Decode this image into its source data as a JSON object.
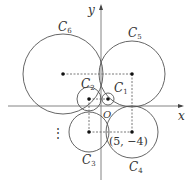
{
  "axes": {
    "x_label": "x",
    "y_label": "y",
    "origin_label": "O",
    "origin_px": [
      101,
      106
    ]
  },
  "circles": [
    {
      "name": "C1",
      "label": "C",
      "sub": "1",
      "cx": 108,
      "cy": 99,
      "r": 6,
      "label_pos": [
        114,
        92
      ]
    },
    {
      "name": "C2",
      "label": "C",
      "sub": "2",
      "cx": 89,
      "cy": 99,
      "r": 12,
      "label_pos": [
        81,
        88
      ]
    },
    {
      "name": "C3",
      "label": "C",
      "sub": "3",
      "cx": 89,
      "cy": 132,
      "r": 20,
      "label_pos": [
        82,
        164
      ]
    },
    {
      "name": "C4",
      "label": "C",
      "sub": "4",
      "cx": 132,
      "cy": 132,
      "r": 26,
      "label_pos": [
        129,
        171
      ]
    },
    {
      "name": "C5",
      "label": "C",
      "sub": "5",
      "cx": 132,
      "cy": 74,
      "r": 33,
      "label_pos": [
        128,
        37
      ]
    },
    {
      "name": "C6",
      "label": "C",
      "sub": "6",
      "cx": 63,
      "cy": 74,
      "r": 40,
      "label_pos": [
        58,
        31
      ]
    }
  ],
  "annotations": {
    "point_label": "(5,  −4)",
    "ellipsis": "⋮"
  },
  "colors": {
    "line": "#555555",
    "dot": "#111111",
    "text": "#333333"
  }
}
